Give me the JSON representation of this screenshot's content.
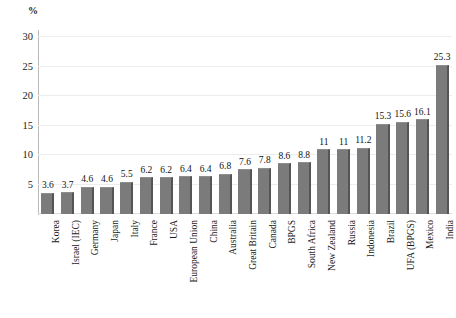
{
  "chart_data": {
    "type": "bar",
    "title": "",
    "subtitle": "",
    "xlabel": "",
    "ylabel": "%",
    "unit_label": "%",
    "ylim": [
      0,
      30
    ],
    "ytick_values": [
      0,
      5,
      10,
      15,
      20,
      25,
      30
    ],
    "ytick_labels": [
      "",
      "5",
      "10",
      "15",
      "20",
      "25",
      "30"
    ],
    "grid": true,
    "legend": false,
    "legend_position": "none",
    "bar_color": "#7b7b7b",
    "bar_shadow_color": "#555555",
    "gridline_color": "#ededed",
    "axis_color": "#b9b9b9",
    "categories": [
      "Korea",
      "Israel (IEC)",
      "Germany",
      "Japan",
      "Italy",
      "France",
      "USA",
      "European Union",
      "China",
      "Australia",
      "Great Britain",
      "Canada",
      "BPGS",
      "South Africa",
      "New Zealand",
      "Russia",
      "Indonesia",
      "Brazil",
      "UFA (BPGS)",
      "Mexico",
      "India"
    ],
    "values": [
      3.6,
      3.7,
      4.6,
      4.6,
      5.5,
      6.2,
      6.2,
      6.4,
      6.4,
      6.8,
      7.6,
      7.8,
      8.6,
      8.8,
      11,
      11,
      11.2,
      15.3,
      15.6,
      16.1,
      25.3
    ],
    "value_labels": [
      "3.6",
      "3.7",
      "4.6",
      "4.6",
      "5.5",
      "6.2",
      "6.2",
      "6.4",
      "6.4",
      "6.8",
      "7.6",
      "7.8",
      "8.6",
      "8.8",
      "11",
      "11",
      "11.2",
      "15.3",
      "15.6",
      "16.1",
      "25.3"
    ]
  }
}
